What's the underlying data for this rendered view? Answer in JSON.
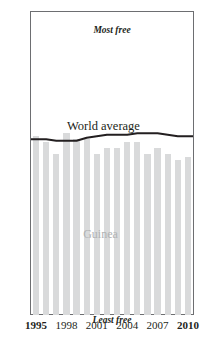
{
  "title": "Guinea",
  "axes": {
    "y_ticks": [
      0,
      20,
      40,
      60,
      80,
      100
    ],
    "x_ticks": [
      {
        "label": "1995",
        "bold": true
      },
      {
        "label": "1998",
        "bold": false
      },
      {
        "label": "2001",
        "bold": false
      },
      {
        "label": "2004",
        "bold": false
      },
      {
        "label": "2007",
        "bold": false
      },
      {
        "label": "2010",
        "bold": true
      }
    ]
  },
  "annotations": {
    "most_free": "Most free",
    "least_free": "Least free",
    "world_average": "World average",
    "series_name": "Guinea"
  },
  "colors": {
    "bar": "#d9dadb",
    "line": "#231f20",
    "axis": "#6d6e71",
    "series_label": "#b0b2b4",
    "background": "#ffffff"
  },
  "chart_data": {
    "type": "bar",
    "title": "Guinea",
    "xlabel": "",
    "ylabel": "",
    "ylim": [
      0,
      100
    ],
    "grid": false,
    "legend": "inline-annotations",
    "categories": [
      "1995",
      "1996",
      "1997",
      "1998",
      "1999",
      "2000",
      "2001",
      "2002",
      "2003",
      "2004",
      "2005",
      "2006",
      "2007",
      "2008",
      "2009",
      "2010"
    ],
    "series": [
      {
        "name": "Guinea",
        "type": "bar",
        "values": [
          59,
          57,
          53,
          60,
          58,
          58,
          53,
          55,
          55,
          57,
          57,
          53,
          55,
          53,
          51,
          52
        ]
      },
      {
        "name": "World average",
        "type": "line",
        "values": [
          58,
          58,
          57.5,
          57.5,
          57.5,
          58.5,
          59,
          59.5,
          59.5,
          59.5,
          60,
          60,
          60,
          59.5,
          59,
          59
        ]
      }
    ],
    "scale_notes": {
      "top_label": "Most free",
      "bottom_label": "Least free"
    }
  }
}
